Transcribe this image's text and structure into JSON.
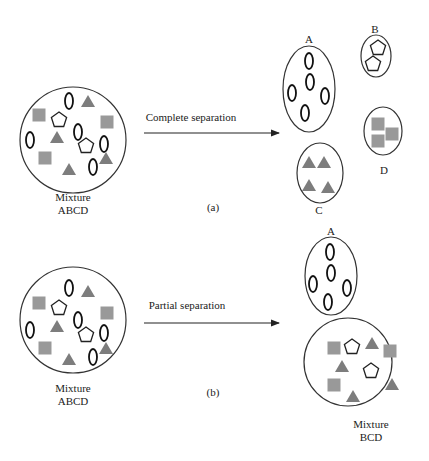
{
  "panel_a": {
    "caption": "(a)",
    "arrow_label": "Complete separation",
    "source": {
      "label_line1": "Mixture",
      "label_line2": "ABCD"
    },
    "products": [
      {
        "label": "A",
        "content": "ellipses"
      },
      {
        "label": "B",
        "content": "pentagons"
      },
      {
        "label": "C",
        "content": "triangles"
      },
      {
        "label": "D",
        "content": "squares"
      }
    ]
  },
  "panel_b": {
    "caption": "(b)",
    "arrow_label": "Partial separation",
    "source": {
      "label_line1": "Mixture",
      "label_line2": "ABCD"
    },
    "products": [
      {
        "label": "A",
        "content": "ellipses"
      },
      {
        "label_line1": "Mixture",
        "label_line2": "BCD",
        "content": "pentagons, triangles, squares"
      }
    ]
  },
  "legend_symbols": {
    "A": "ellipse-outline",
    "B": "pentagon-outline",
    "C": "gray-triangle",
    "D": "gray-square"
  },
  "colors": {
    "square": "#999999",
    "triangle": "#7d7d7d",
    "outline": "#222222"
  }
}
